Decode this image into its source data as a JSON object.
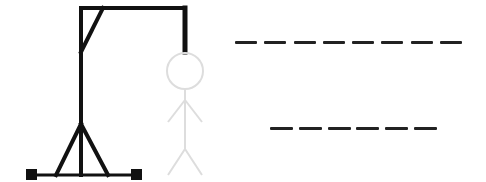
{
  "game": {
    "name": "hangman",
    "wrong_guesses": 0,
    "max_wrong_guesses": 6
  },
  "colors": {
    "gallows": "#111111",
    "figure_pending": "#dddddd",
    "blank": "#222222",
    "background": "#ffffff"
  },
  "words": [
    {
      "length": 8,
      "letters": [
        "",
        "",
        "",
        "",
        "",
        "",
        "",
        ""
      ],
      "x": 235,
      "y": 41,
      "blank_width": 22,
      "gap": 7.3
    },
    {
      "length": 6,
      "letters": [
        "",
        "",
        "",
        "",
        "",
        ""
      ],
      "x": 270,
      "y": 127,
      "blank_width": 23,
      "gap": 5.8
    }
  ],
  "figure_parts": [
    "head",
    "body",
    "left-arm",
    "right-arm",
    "left-leg",
    "right-leg"
  ]
}
